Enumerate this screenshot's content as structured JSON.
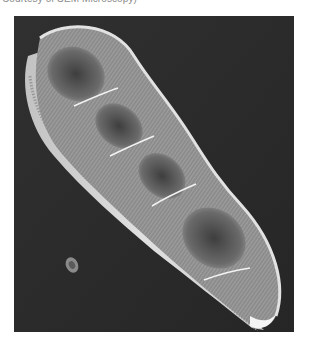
{
  "caption": {
    "text": "Courtesy of SEM Microscopy)"
  },
  "figure": {
    "modality": "scanning electron micrograph",
    "background_color": "#2b2b2b",
    "specimen_highlight_color": "#e6e6e6",
    "specimen_shadow_color": "#5a5a5a",
    "features": [
      {
        "name": "valve-body",
        "description": "elongated curved valve with three constrictions"
      },
      {
        "name": "striae",
        "description": "fine radial striations along margin"
      },
      {
        "name": "girdle-band",
        "description": "bright girdle along lower edge"
      },
      {
        "name": "debris-particle",
        "description": "small particle lower left"
      }
    ]
  }
}
